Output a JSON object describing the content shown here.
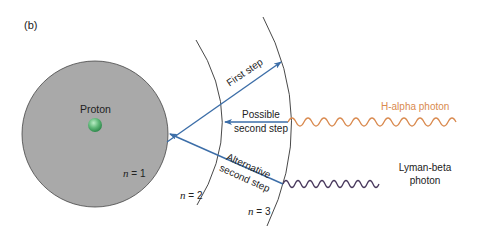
{
  "figure": {
    "panel_label": "(b)",
    "proton_label": "Proton",
    "levels": [
      {
        "var": "n",
        "eq": "= 1"
      },
      {
        "var": "n",
        "eq": "= 2"
      },
      {
        "var": "n",
        "eq": "= 3"
      }
    ],
    "steps": {
      "first": "First step",
      "possible_second_1": "Possible",
      "possible_second_2": "second step",
      "alternative_1": "Alternative",
      "alternative_2": "second step"
    },
    "photons": {
      "h_alpha": "H-alpha photon",
      "lyman_beta_1": "Lyman-beta",
      "lyman_beta_2": "photon"
    },
    "colors": {
      "atom_fill": "#a9a9a9",
      "proton": "#5fb878",
      "arrow": "#3c6ea8",
      "h_alpha": "#d98a4f",
      "lyman_beta": "#4a3a5e",
      "orbit": "#333333"
    }
  }
}
